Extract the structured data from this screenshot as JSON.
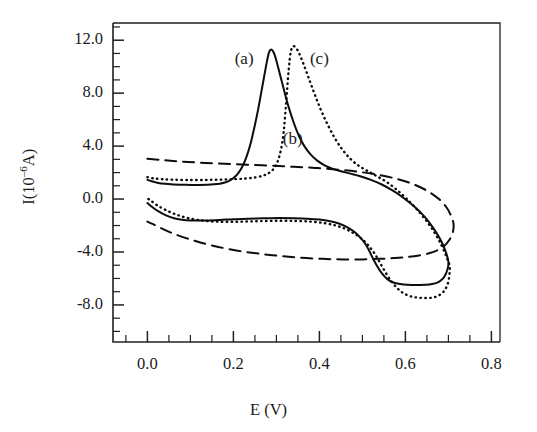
{
  "figure": {
    "background_color": "#ffffff",
    "ink_color": "#0d0d0d"
  },
  "chart_data": {
    "type": "line",
    "title": "",
    "subtitle": "",
    "xlabel": "E (V)",
    "ylabel": "I(10–6A)",
    "ylabel_parts": {
      "lead": "I(10",
      "exponent": "–6",
      "trail": "A)"
    },
    "xlim": [
      -0.08,
      0.82
    ],
    "ylim": [
      -10.8,
      13.3
    ],
    "grid": false,
    "legend_position": "inline-annotations",
    "x_ticks_major": [
      0.0,
      0.2,
      0.4,
      0.6,
      0.8
    ],
    "x_tick_labels": [
      "0.0",
      "0.2",
      "0.4",
      "0.6",
      "0.8"
    ],
    "x_minor_tick_step": 0.05,
    "y_ticks_major": [
      12.0,
      8.0,
      4.0,
      0.0,
      -4.0,
      -8.0
    ],
    "y_tick_labels": [
      "12.0",
      "8.0",
      "4.0",
      "0.0",
      "-4.0",
      "-8.0"
    ],
    "y_minor_tick_step": 1.0,
    "annotations": [
      {
        "text": "(a)",
        "x": 0.225,
        "y": 10.4
      },
      {
        "text": "(b)",
        "x": 0.338,
        "y": 4.35
      },
      {
        "text": "(c)",
        "x": 0.4,
        "y": 10.4
      }
    ],
    "series": [
      {
        "name": "(a)",
        "style": "solid",
        "description": "cyclic voltammogram with sharp anodic peak near 0.285 V",
        "anodic_peak": {
          "x": 0.285,
          "y": 11.3
        },
        "cathodic_peak": {
          "x": 0.565,
          "y": -6.5
        },
        "forward": [
          [
            0.0,
            1.45
          ],
          [
            0.012,
            1.32
          ],
          [
            0.025,
            1.22
          ],
          [
            0.04,
            1.15
          ],
          [
            0.06,
            1.1
          ],
          [
            0.08,
            1.08
          ],
          [
            0.1,
            1.07
          ],
          [
            0.12,
            1.07
          ],
          [
            0.14,
            1.08
          ],
          [
            0.155,
            1.11
          ],
          [
            0.168,
            1.16
          ],
          [
            0.18,
            1.25
          ],
          [
            0.19,
            1.38
          ],
          [
            0.2,
            1.58
          ],
          [
            0.21,
            1.9
          ],
          [
            0.22,
            2.4
          ],
          [
            0.23,
            3.15
          ],
          [
            0.24,
            4.2
          ],
          [
            0.25,
            5.6
          ],
          [
            0.258,
            6.85
          ],
          [
            0.265,
            8.1
          ],
          [
            0.272,
            9.35
          ],
          [
            0.278,
            10.4
          ],
          [
            0.283,
            11.1
          ],
          [
            0.288,
            11.3
          ],
          [
            0.294,
            11.05
          ],
          [
            0.3,
            10.45
          ],
          [
            0.308,
            9.45
          ],
          [
            0.318,
            8.2
          ],
          [
            0.328,
            7.0
          ],
          [
            0.34,
            5.8
          ],
          [
            0.352,
            4.8
          ],
          [
            0.365,
            4.0
          ],
          [
            0.38,
            3.35
          ],
          [
            0.395,
            2.9
          ],
          [
            0.412,
            2.55
          ],
          [
            0.43,
            2.3
          ],
          [
            0.45,
            2.1
          ],
          [
            0.472,
            1.92
          ],
          [
            0.495,
            1.72
          ],
          [
            0.52,
            1.45
          ],
          [
            0.545,
            1.1
          ],
          [
            0.57,
            0.65
          ],
          [
            0.595,
            0.1
          ],
          [
            0.62,
            -0.55
          ],
          [
            0.645,
            -1.35
          ],
          [
            0.665,
            -2.2
          ],
          [
            0.682,
            -3.1
          ],
          [
            0.694,
            -4.0
          ],
          [
            0.7,
            -4.75
          ]
        ],
        "reverse": [
          [
            0.7,
            -4.75
          ],
          [
            0.698,
            -5.3
          ],
          [
            0.69,
            -5.9
          ],
          [
            0.678,
            -6.25
          ],
          [
            0.662,
            -6.42
          ],
          [
            0.645,
            -6.48
          ],
          [
            0.625,
            -6.5
          ],
          [
            0.605,
            -6.48
          ],
          [
            0.588,
            -6.42
          ],
          [
            0.572,
            -6.3
          ],
          [
            0.558,
            -6.05
          ],
          [
            0.545,
            -5.6
          ],
          [
            0.534,
            -5.05
          ],
          [
            0.524,
            -4.45
          ],
          [
            0.515,
            -3.85
          ],
          [
            0.505,
            -3.3
          ],
          [
            0.492,
            -2.8
          ],
          [
            0.478,
            -2.4
          ],
          [
            0.462,
            -2.08
          ],
          [
            0.445,
            -1.85
          ],
          [
            0.425,
            -1.68
          ],
          [
            0.4,
            -1.55
          ],
          [
            0.372,
            -1.48
          ],
          [
            0.34,
            -1.45
          ],
          [
            0.305,
            -1.44
          ],
          [
            0.27,
            -1.45
          ],
          [
            0.235,
            -1.48
          ],
          [
            0.2,
            -1.52
          ],
          [
            0.168,
            -1.58
          ],
          [
            0.138,
            -1.62
          ],
          [
            0.11,
            -1.62
          ],
          [
            0.085,
            -1.58
          ],
          [
            0.062,
            -1.45
          ],
          [
            0.042,
            -1.22
          ],
          [
            0.025,
            -0.92
          ],
          [
            0.012,
            -0.62
          ],
          [
            0.0,
            -0.3
          ]
        ]
      },
      {
        "name": "(b)",
        "style": "dashed",
        "description": "featureless capacitive background curve, no redox peaks",
        "forward": [
          [
            0.0,
            3.05
          ],
          [
            0.03,
            2.96
          ],
          [
            0.06,
            2.88
          ],
          [
            0.095,
            2.8
          ],
          [
            0.135,
            2.73
          ],
          [
            0.18,
            2.66
          ],
          [
            0.23,
            2.6
          ],
          [
            0.285,
            2.52
          ],
          [
            0.34,
            2.44
          ],
          [
            0.395,
            2.34
          ],
          [
            0.45,
            2.2
          ],
          [
            0.5,
            2.02
          ],
          [
            0.545,
            1.78
          ],
          [
            0.585,
            1.48
          ],
          [
            0.62,
            1.1
          ],
          [
            0.652,
            0.6
          ],
          [
            0.678,
            0.0
          ],
          [
            0.695,
            -0.6
          ],
          [
            0.706,
            -1.25
          ],
          [
            0.712,
            -1.9
          ]
        ],
        "reverse": [
          [
            0.712,
            -1.9
          ],
          [
            0.71,
            -2.55
          ],
          [
            0.702,
            -3.1
          ],
          [
            0.69,
            -3.55
          ],
          [
            0.674,
            -3.88
          ],
          [
            0.655,
            -4.1
          ],
          [
            0.632,
            -4.26
          ],
          [
            0.605,
            -4.38
          ],
          [
            0.575,
            -4.46
          ],
          [
            0.54,
            -4.52
          ],
          [
            0.5,
            -4.56
          ],
          [
            0.455,
            -4.56
          ],
          [
            0.408,
            -4.52
          ],
          [
            0.358,
            -4.44
          ],
          [
            0.308,
            -4.3
          ],
          [
            0.258,
            -4.12
          ],
          [
            0.21,
            -3.9
          ],
          [
            0.165,
            -3.62
          ],
          [
            0.125,
            -3.3
          ],
          [
            0.09,
            -2.95
          ],
          [
            0.058,
            -2.58
          ],
          [
            0.032,
            -2.2
          ],
          [
            0.012,
            -1.88
          ],
          [
            0.0,
            -1.7
          ]
        ]
      },
      {
        "name": "(c)",
        "style": "dotted",
        "description": "cyclic voltammogram with anodic peak shifted positive near 0.325 V",
        "anodic_peak": {
          "x": 0.325,
          "y": 11.55
        },
        "cathodic_peak": {
          "x": 0.61,
          "y": -7.45
        },
        "forward": [
          [
            0.0,
            1.65
          ],
          [
            0.015,
            1.56
          ],
          [
            0.035,
            1.5
          ],
          [
            0.06,
            1.46
          ],
          [
            0.09,
            1.44
          ],
          [
            0.125,
            1.44
          ],
          [
            0.16,
            1.46
          ],
          [
            0.195,
            1.49
          ],
          [
            0.228,
            1.55
          ],
          [
            0.252,
            1.64
          ],
          [
            0.27,
            1.78
          ],
          [
            0.283,
            1.98
          ],
          [
            0.294,
            2.3
          ],
          [
            0.303,
            2.85
          ],
          [
            0.311,
            3.8
          ],
          [
            0.317,
            5.1
          ],
          [
            0.321,
            6.6
          ],
          [
            0.325,
            8.3
          ],
          [
            0.329,
            9.9
          ],
          [
            0.333,
            11.05
          ],
          [
            0.338,
            11.52
          ],
          [
            0.345,
            11.45
          ],
          [
            0.353,
            11.0
          ],
          [
            0.363,
            10.2
          ],
          [
            0.375,
            9.15
          ],
          [
            0.388,
            8.0
          ],
          [
            0.402,
            6.85
          ],
          [
            0.418,
            5.7
          ],
          [
            0.435,
            4.65
          ],
          [
            0.452,
            3.8
          ],
          [
            0.47,
            3.1
          ],
          [
            0.49,
            2.55
          ],
          [
            0.512,
            2.12
          ],
          [
            0.535,
            1.7
          ],
          [
            0.558,
            1.25
          ],
          [
            0.58,
            0.7
          ],
          [
            0.602,
            0.05
          ],
          [
            0.625,
            -0.72
          ],
          [
            0.648,
            -1.6
          ],
          [
            0.668,
            -2.55
          ],
          [
            0.684,
            -3.5
          ],
          [
            0.696,
            -4.4
          ],
          [
            0.703,
            -5.1
          ]
        ],
        "reverse": [
          [
            0.703,
            -5.1
          ],
          [
            0.702,
            -5.8
          ],
          [
            0.698,
            -6.45
          ],
          [
            0.69,
            -6.95
          ],
          [
            0.678,
            -7.28
          ],
          [
            0.664,
            -7.44
          ],
          [
            0.648,
            -7.48
          ],
          [
            0.63,
            -7.45
          ],
          [
            0.612,
            -7.35
          ],
          [
            0.595,
            -7.1
          ],
          [
            0.58,
            -6.7
          ],
          [
            0.566,
            -6.15
          ],
          [
            0.553,
            -5.5
          ],
          [
            0.541,
            -4.82
          ],
          [
            0.529,
            -4.15
          ],
          [
            0.515,
            -3.55
          ],
          [
            0.5,
            -3.05
          ],
          [
            0.482,
            -2.62
          ],
          [
            0.462,
            -2.28
          ],
          [
            0.44,
            -2.02
          ],
          [
            0.415,
            -1.84
          ],
          [
            0.385,
            -1.72
          ],
          [
            0.35,
            -1.66
          ],
          [
            0.312,
            -1.64
          ],
          [
            0.272,
            -1.66
          ],
          [
            0.232,
            -1.7
          ],
          [
            0.192,
            -1.72
          ],
          [
            0.155,
            -1.7
          ],
          [
            0.122,
            -1.6
          ],
          [
            0.092,
            -1.42
          ],
          [
            0.065,
            -1.15
          ],
          [
            0.042,
            -0.82
          ],
          [
            0.022,
            -0.45
          ],
          [
            0.008,
            -0.12
          ],
          [
            0.0,
            0.05
          ]
        ]
      }
    ]
  }
}
